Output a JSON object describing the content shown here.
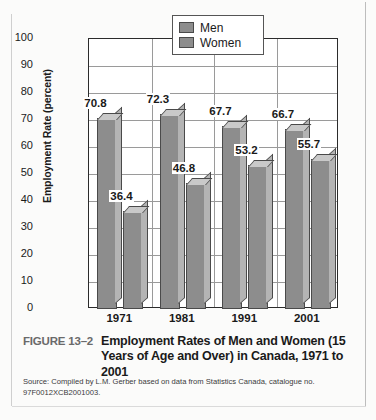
{
  "chart_data": {
    "type": "bar",
    "title": "Employment Rates of Men and Women (15 Years of Age and Over) in Canada, 1971 to 2001",
    "xlabel": "",
    "ylabel": "Employment Rate (percent)",
    "ylim": [
      0,
      100
    ],
    "yticks": [
      100,
      90,
      80,
      70,
      60,
      50,
      40,
      30,
      20,
      10,
      0
    ],
    "grid": true,
    "legend_position": "top-center",
    "categories": [
      "1971",
      "1981",
      "1991",
      "2001"
    ],
    "series": [
      {
        "name": "Men",
        "values": [
          70.8,
          72.3,
          67.7,
          66.7
        ]
      },
      {
        "name": "Women",
        "values": [
          36.4,
          46.8,
          53.2,
          55.7
        ]
      }
    ],
    "bar_labels": [
      "70.8",
      "36.4",
      "72.3",
      "46.8",
      "67.7",
      "53.2",
      "66.7",
      "55.7"
    ],
    "colors": {
      "men_bar": "#8d8d8d",
      "women_bar": "#8d8d8d",
      "bar_outline": "#4a4a4a",
      "gridline": "#9a9a9a",
      "axis": "#2b2b2b"
    }
  },
  "legend": {
    "items": [
      {
        "label": "Men"
      },
      {
        "label": "Women"
      }
    ]
  },
  "caption": {
    "figure_number": "FIGURE 13–2",
    "title": "Employment Rates of Men and Women (15 Years of Age and Over) in Canada, 1971 to 2001"
  },
  "source": {
    "text": "Source: Compiled by L.M. Gerber based on data from Statistics Canada, catalogue no. 97F0012XCB2001003."
  }
}
